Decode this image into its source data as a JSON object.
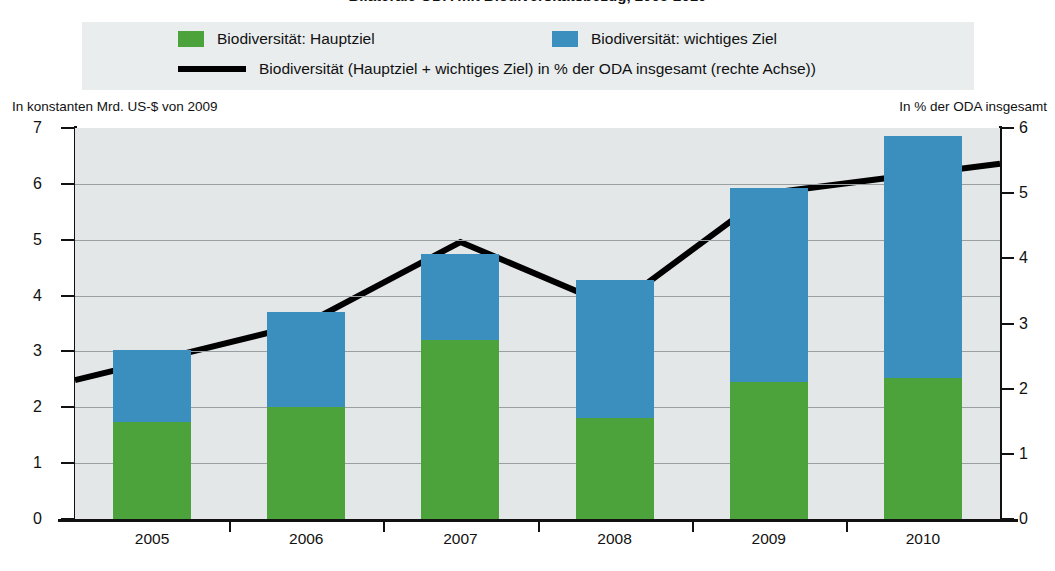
{
  "title": "Bilaterale ODA mit Biodiversitätsbezug, 2005-2010",
  "legend": {
    "items": [
      {
        "label": "Biodiversität: Hauptziel",
        "marker": "green-square-swatch",
        "color": "#4ca33c"
      },
      {
        "label": "Biodiversität: wichtiges Ziel",
        "marker": "blue-square-swatch",
        "color": "#3a8fbf"
      },
      {
        "label": "Biodiversität (Hauptziel + wichtiges Ziel) in % der ODA insgesamt (rechte Achse))",
        "marker": "black-line-swatch",
        "color": "#000000"
      }
    ],
    "background": "#e9edee"
  },
  "axis_captions": {
    "left": "In konstanten Mrd. US-$ von 2009",
    "right": "In % der ODA insgesamt"
  },
  "chart_data": {
    "type": "bar",
    "title": "Bilaterale ODA mit Biodiversitätsbezug, 2005-2010",
    "categories": [
      "2005",
      "2006",
      "2007",
      "2008",
      "2009",
      "2010"
    ],
    "xlabel": "",
    "ylabel": "In konstanten Mrd. US-$ von 2009",
    "y2label": "In % der ODA insgesamt",
    "ylim": [
      0,
      7
    ],
    "y2lim": [
      0,
      6
    ],
    "yticks": [
      "0",
      "1",
      "2",
      "3",
      "4",
      "5",
      "6",
      "7"
    ],
    "y2ticks": [
      "0",
      "1",
      "2",
      "3",
      "4",
      "5",
      "6"
    ],
    "grid": true,
    "legend_position": "top",
    "stacked": true,
    "series": [
      {
        "name": "Biodiversität: Hauptziel",
        "type": "bar",
        "color": "#4ca33c",
        "axis": "left",
        "values": [
          1.73,
          2.0,
          3.2,
          1.8,
          2.45,
          2.52
        ]
      },
      {
        "name": "Biodiversität: wichtiges Ziel",
        "type": "bar",
        "color": "#3a8fbf",
        "axis": "left",
        "values": [
          1.29,
          1.7,
          1.55,
          2.48,
          3.47,
          4.33
        ]
      },
      {
        "name": "Biodiversität (Hauptziel + wichtiges Ziel) in % der ODA insgesamt (rechte Achse))",
        "type": "line",
        "color": "#000000",
        "axis": "right",
        "values": [
          2.42,
          3.0,
          4.25,
          3.25,
          5.0,
          5.3
        ]
      }
    ],
    "totals": [
      3.02,
      3.7,
      4.75,
      4.28,
      5.92,
      6.85
    ]
  }
}
